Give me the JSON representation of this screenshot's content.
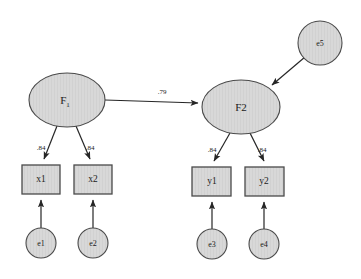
{
  "diagram": {
    "type": "structural-equation-model-path-diagram",
    "background_color": "#ffffff",
    "node_fill_color": "#d8d8d8",
    "node_stroke_color": "#4a4a4a",
    "path_color": "#262626",
    "latent_factors": [
      {
        "id": "F1",
        "label": "F",
        "subscript": "1",
        "cx": 67,
        "cy": 100,
        "rx": 38,
        "ry": 27
      },
      {
        "id": "F2",
        "label": "F2",
        "subscript": "",
        "cx": 241,
        "cy": 107,
        "rx": 39,
        "ry": 27
      }
    ],
    "observed_variables": [
      {
        "id": "x1",
        "label": "x1",
        "x": 22,
        "y": 165,
        "w": 38,
        "h": 29
      },
      {
        "id": "x2",
        "label": "x2",
        "x": 74,
        "y": 165,
        "w": 38,
        "h": 29
      },
      {
        "id": "y1",
        "label": "y1",
        "x": 192,
        "y": 167,
        "w": 39,
        "h": 29
      },
      {
        "id": "y2",
        "label": "y2",
        "x": 245,
        "y": 167,
        "w": 39,
        "h": 29
      }
    ],
    "error_terms": [
      {
        "id": "e1",
        "label": "e1",
        "cx": 41,
        "cy": 243,
        "r": 15
      },
      {
        "id": "e2",
        "label": "e2",
        "cx": 93,
        "cy": 243,
        "r": 15
      },
      {
        "id": "e3",
        "label": "e3",
        "cx": 212,
        "cy": 244,
        "r": 15
      },
      {
        "id": "e4",
        "label": "e4",
        "cx": 264,
        "cy": 244,
        "r": 15
      },
      {
        "id": "e5",
        "label": "e5",
        "cx": 320,
        "cy": 43,
        "r": 22
      }
    ],
    "paths": [
      {
        "id": "F1-to-F2",
        "from": "F1",
        "to": "F2",
        "coefficient": ".79",
        "label_x": 162,
        "label_y": 92
      },
      {
        "id": "F1-to-x1",
        "from": "F1",
        "to": "x1",
        "coefficient": ".84",
        "label_x": 41,
        "label_y": 148
      },
      {
        "id": "F1-to-x2",
        "from": "F1",
        "to": "x2",
        "coefficient": ".84",
        "label_x": 90,
        "label_y": 148
      },
      {
        "id": "F2-to-y1",
        "from": "F2",
        "to": "y1",
        "coefficient": ".84",
        "label_x": 212,
        "label_y": 150
      },
      {
        "id": "F2-to-y2",
        "from": "F2",
        "to": "y2",
        "coefficient": ".84",
        "label_x": 262,
        "label_y": 150
      },
      {
        "id": "e1-to-x1",
        "from": "e1",
        "to": "x1",
        "coefficient": "",
        "label_x": 0,
        "label_y": 0
      },
      {
        "id": "e2-to-x2",
        "from": "e2",
        "to": "x2",
        "coefficient": "",
        "label_x": 0,
        "label_y": 0
      },
      {
        "id": "e3-to-y1",
        "from": "e3",
        "to": "y1",
        "coefficient": "",
        "label_x": 0,
        "label_y": 0
      },
      {
        "id": "e4-to-y2",
        "from": "e4",
        "to": "y2",
        "coefficient": "",
        "label_x": 0,
        "label_y": 0
      },
      {
        "id": "e5-to-F2",
        "from": "e5",
        "to": "F2",
        "coefficient": "",
        "label_x": 0,
        "label_y": 0
      }
    ]
  }
}
